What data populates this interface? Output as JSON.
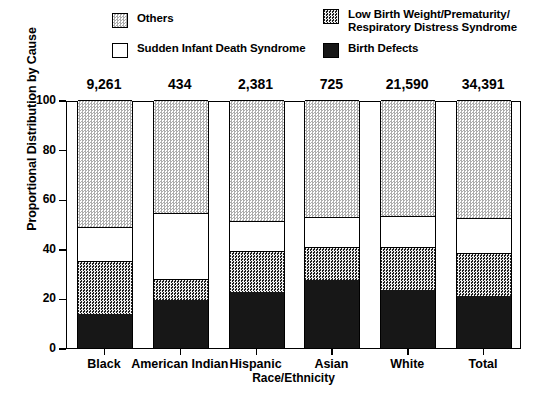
{
  "legend": {
    "left_entries": [
      {
        "label": "Others",
        "key": "others",
        "swatch": "light-stipple-swatch"
      },
      {
        "label": "Sudden Infant Death Syndrome",
        "key": "sids",
        "swatch": "white-swatch"
      }
    ],
    "right_entries": [
      {
        "label": "Low Birth Weight/Prematurity/\nRespiratory Distress Syndrome",
        "key": "lbw",
        "swatch": "dark-stipple-swatch"
      },
      {
        "label": "Birth Defects",
        "key": "bd",
        "swatch": "black-swatch"
      }
    ]
  },
  "axes": {
    "y_title": "Proportional Distribution by Cause",
    "x_title": "Race/Ethnicity",
    "y_ticks": [
      "0",
      "20",
      "40",
      "60",
      "80",
      "100"
    ],
    "y_min": 0,
    "y_max": 100
  },
  "totals_row": {
    "values": [
      "9,261",
      "434",
      "2,381",
      "725",
      "21,590",
      "34,391"
    ]
  },
  "colors": {
    "axis": "#000000",
    "others": "#adadad",
    "sids": "#ffffff",
    "lbw": "#2a2a2a",
    "birth_defects": "#171717"
  },
  "chart_data": {
    "type": "bar",
    "stacked": true,
    "stack_mode": "percent",
    "title": "",
    "xlabel": "Race/Ethnicity",
    "ylabel": "Proportional Distribution by Cause",
    "ylim": [
      0,
      100
    ],
    "grid": false,
    "legend_position": "top",
    "categories": [
      "Black",
      "American Indian",
      "Hispanic",
      "Asian",
      "White",
      "Total"
    ],
    "category_totals": [
      9261,
      434,
      2381,
      725,
      21590,
      34391
    ],
    "category_totals_formatted": [
      "9,261",
      "434",
      "2,381",
      "725",
      "21,590",
      "34,391"
    ],
    "series": [
      {
        "name": "Birth Defects",
        "key": "bd",
        "values": [
          13.7,
          19.4,
          22.6,
          27.4,
          23.4,
          21.0
        ]
      },
      {
        "name": "Low Birth Weight/Prematurity/Respiratory Distress Syndrome",
        "key": "lbw",
        "values": [
          21.3,
          8.4,
          16.5,
          13.3,
          17.3,
          17.3
        ]
      },
      {
        "name": "Sudden Infant Death Syndrome",
        "key": "sids",
        "values": [
          13.8,
          26.6,
          12.1,
          12.1,
          12.5,
          14.1
        ]
      },
      {
        "name": "Others",
        "key": "others",
        "values": [
          51.2,
          45.6,
          48.8,
          47.2,
          46.8,
          47.6
        ]
      }
    ],
    "annotations": [
      "Counts shown above each bar"
    ]
  }
}
